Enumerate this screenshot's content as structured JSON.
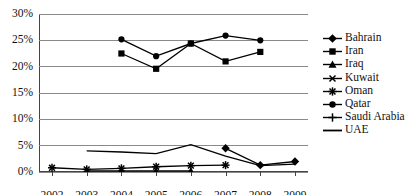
{
  "chart_data": {
    "type": "line",
    "title": "",
    "xlabel": "",
    "ylabel": "",
    "x": [
      2002,
      2003,
      2004,
      2005,
      2006,
      2007,
      2008,
      2009
    ],
    "xtick_labels": [
      "2002",
      "2003",
      "2004",
      "2005",
      "2006",
      "2007",
      "2008",
      "2009"
    ],
    "ytick_labels": [
      "0%",
      "5%",
      "10%",
      "15%",
      "20%",
      "25%",
      "30%"
    ],
    "ytick_values": [
      0,
      5,
      10,
      15,
      20,
      25,
      30
    ],
    "ylim": [
      0,
      30
    ],
    "grid": true,
    "legend_position": "right",
    "series": [
      {
        "name": "Bahrain",
        "marker": "diamond",
        "color": "#000000",
        "points": [
          {
            "x": 2007,
            "y": 4.5
          },
          {
            "x": 2008,
            "y": 1.3
          },
          {
            "x": 2009,
            "y": 2.0
          }
        ]
      },
      {
        "name": "Iran",
        "marker": "square",
        "color": "#000000",
        "points": [
          {
            "x": 2004,
            "y": 22.5
          },
          {
            "x": 2005,
            "y": 19.6
          },
          {
            "x": 2006,
            "y": 24.4
          },
          {
            "x": 2007,
            "y": 21.0
          },
          {
            "x": 2008,
            "y": 22.8
          }
        ]
      },
      {
        "name": "Iraq",
        "marker": "triangle",
        "color": "#000000",
        "points": [
          {
            "x": 2003,
            "y": 0.2
          },
          {
            "x": 2004,
            "y": 0.2
          },
          {
            "x": 2005,
            "y": 0.2
          },
          {
            "x": 2006,
            "y": 0.2
          }
        ]
      },
      {
        "name": "Kuwait",
        "marker": "x",
        "color": "#000000",
        "points": []
      },
      {
        "name": "Oman",
        "marker": "asterisk",
        "color": "#000000",
        "points": [
          {
            "x": 2002,
            "y": 0.8
          },
          {
            "x": 2003,
            "y": 0.5
          },
          {
            "x": 2004,
            "y": 0.7
          },
          {
            "x": 2005,
            "y": 1.0
          },
          {
            "x": 2006,
            "y": 1.2
          },
          {
            "x": 2007,
            "y": 1.3
          }
        ]
      },
      {
        "name": "Qatar",
        "marker": "circle",
        "color": "#000000",
        "points": [
          {
            "x": 2004,
            "y": 25.2
          },
          {
            "x": 2005,
            "y": 22.0
          },
          {
            "x": 2006,
            "y": 24.4
          },
          {
            "x": 2007,
            "y": 25.9
          },
          {
            "x": 2008,
            "y": 25.0
          }
        ]
      },
      {
        "name": "Saudi Arabia",
        "marker": "plus",
        "color": "#000000",
        "points": []
      },
      {
        "name": "UAE",
        "marker": "line",
        "color": "#000000",
        "points": [
          {
            "x": 2003,
            "y": 4.0
          },
          {
            "x": 2004,
            "y": 3.8
          },
          {
            "x": 2005,
            "y": 3.5
          },
          {
            "x": 2006,
            "y": 5.2
          },
          {
            "x": 2007,
            "y": 3.0
          },
          {
            "x": 2008,
            "y": 1.2
          },
          {
            "x": 2009,
            "y": 1.5
          }
        ]
      }
    ]
  },
  "legend": {
    "items": [
      {
        "label": "Bahrain",
        "marker": "diamond"
      },
      {
        "label": "Iran",
        "marker": "square"
      },
      {
        "label": "Iraq",
        "marker": "triangle"
      },
      {
        "label": "Kuwait",
        "marker": "x"
      },
      {
        "label": "Oman",
        "marker": "asterisk"
      },
      {
        "label": "Qatar",
        "marker": "circle"
      },
      {
        "label": "Saudi Arabia",
        "marker": "plus"
      },
      {
        "label": "UAE",
        "marker": "line"
      }
    ]
  },
  "colors": {
    "series": "#000000",
    "gridline": "#8a8a8a",
    "axis": "#444444",
    "text": "#111111",
    "background": "#ffffff"
  }
}
